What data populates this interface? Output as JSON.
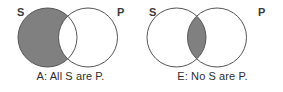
{
  "figure": {
    "background_color": "#ffffff",
    "shade_color": "#808080",
    "stroke_color": "#555555",
    "text_color": "#2e2e2e"
  },
  "diagrams": [
    {
      "id": "A",
      "label_left": "S",
      "label_right": "P",
      "caption": "A: All S are P.",
      "shaded_region": "subject-only",
      "shaded_region_description": "The part of circle S that lies outside circle P is shaded."
    },
    {
      "id": "E",
      "label_left": "S",
      "label_right": "P",
      "caption": "E: No S are P.",
      "shaded_region": "intersection",
      "shaded_region_description": "The overlapping lens between circle S and circle P is shaded."
    }
  ]
}
